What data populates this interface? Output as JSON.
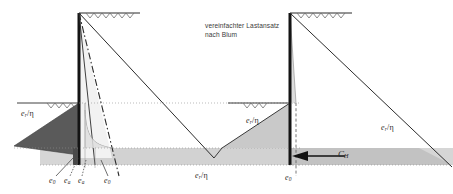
{
  "figure": {
    "kind": "geotechnical-earth-pressure-diagram",
    "note": {
      "line1": "vereinfachter Lastansatz",
      "line2": "nach Blum"
    },
    "labels": {
      "left_wedge_pressure": {
        "symbol": "e",
        "sub": "r",
        "divisor": "η",
        "text": "e_r/η"
      },
      "middle_pressure": {
        "symbol": "e",
        "sub": "r",
        "divisor": "η",
        "text": "e_r/η"
      },
      "right_wedge_pressure": {
        "symbol": "e",
        "sub": "r",
        "divisor": "η",
        "text": "e_r/η"
      },
      "far_right_pressure": {
        "symbol": "e",
        "sub": "r",
        "divisor": "η",
        "text": "e_r/η"
      },
      "resultant_force": {
        "symbol": "C",
        "sub": "H",
        "text": "C_H"
      },
      "bottom_axis": [
        {
          "symbol": "e",
          "sub": "0",
          "text": "e_0"
        },
        {
          "symbol": "e",
          "sub": "a",
          "text": "e_a"
        },
        {
          "symbol": "e",
          "sub": "a",
          "text": "e_a"
        },
        {
          "symbol": "e",
          "sub": "0",
          "text": "e_0"
        }
      ],
      "right_bottom_axis": {
        "symbol": "e",
        "sub": "0",
        "text": "e_0"
      }
    },
    "colors": {
      "stroke": "#2b2b2b",
      "wall": "#1a1a1a",
      "dark_wedge": "#585858",
      "mid_gray_band": "#c0c0c0",
      "light_gray_band": "#d8d8d8",
      "light_wedge": "#cdcdcd",
      "pale_fill": "#e8e8e8",
      "dotted": "#8a8a8a",
      "background": "#ffffff"
    },
    "geometry": {
      "left_wall_x": 79,
      "right_wall_x": 290,
      "ground_y": 13,
      "excavation_y": 103,
      "band_top_y": 148,
      "band_bottom_y": 165
    }
  }
}
